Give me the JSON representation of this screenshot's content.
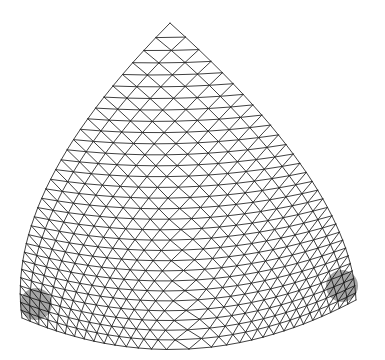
{
  "figure": {
    "background": "#ffffff",
    "line_color": "#2a2a2a",
    "corners": {
      "top": [
        170,
        23
      ],
      "bottom_left": [
        22,
        318
      ],
      "bottom_right": [
        356,
        300
      ]
    },
    "edge_bulge": {
      "left": [
        -46,
        10
      ],
      "right": [
        44,
        12
      ],
      "bottom": [
        0,
        40
      ]
    },
    "subdivisions": 30,
    "corner_refinement": 1.35
  }
}
